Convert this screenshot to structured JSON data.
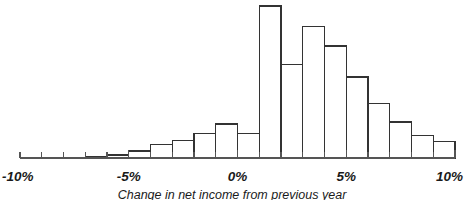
{
  "chart_data": {
    "type": "bar",
    "title": "",
    "xlabel": "Change in net income from previous year",
    "ylabel": "",
    "xlim": [
      -10,
      10
    ],
    "ylim": [
      0,
      160
    ],
    "grid": false,
    "legend": null,
    "bin_width": 1,
    "x_unit": "%",
    "categories": [
      "-7% to -6%",
      "-6% to -5%",
      "-5% to -4%",
      "-4% to -3%",
      "-3% to -2%",
      "-2% to -1%",
      "-1% to 0%",
      "0% to 1%",
      "1% to 2%",
      "2% to 3%",
      "3% to 4%",
      "4% to 5%",
      "5% to 6%",
      "6% to 7%",
      "7% to 8%",
      "8% to 9%",
      "9% to 10%"
    ],
    "bin_starts": [
      -7,
      -6,
      -5,
      -4,
      -3,
      -2,
      -1,
      0,
      1,
      2,
      3,
      4,
      5,
      6,
      7,
      8,
      9
    ],
    "values": [
      1,
      3,
      7,
      14,
      18,
      25,
      35,
      25,
      156,
      96,
      135,
      115,
      83,
      56,
      37,
      23,
      17
    ],
    "tick_values": [
      -10,
      -5,
      0,
      5,
      10
    ],
    "tick_labels": [
      "-10%",
      "-5%",
      "0%",
      "5%",
      "10%"
    ],
    "minor_tick_step": 1,
    "colors": {
      "bar_fill": "#ffffff",
      "bar_stroke": "#333333",
      "axis": "#555555",
      "text": "#1a1a1a",
      "background": "#ffffff"
    }
  }
}
